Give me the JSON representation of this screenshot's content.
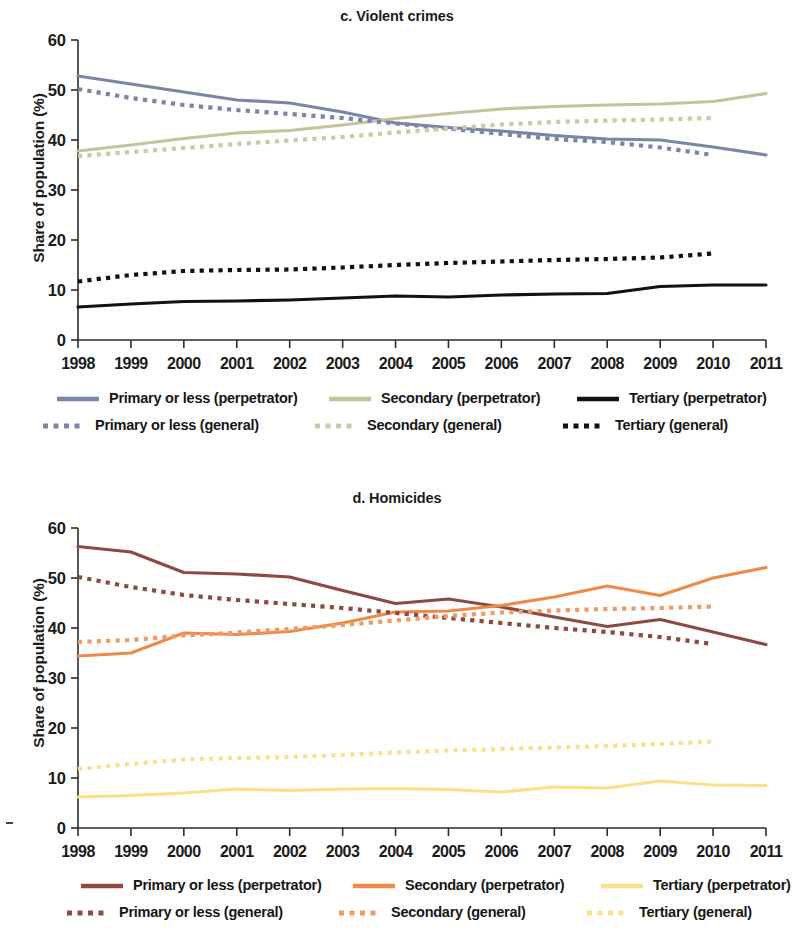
{
  "figure": {
    "panels": [
      {
        "id": "c",
        "title": "c. Violent crimes",
        "ylabel": "Share of population (%)"
      },
      {
        "id": "d",
        "title": "d. Homicides",
        "ylabel": "Share of population (%)"
      }
    ]
  },
  "axis": {
    "y_ticks": [
      "0",
      "10",
      "20",
      "30",
      "40",
      "50",
      "60"
    ],
    "x_ticks": [
      "1998",
      "1999",
      "2000",
      "2001",
      "2002",
      "2003",
      "2004",
      "2005",
      "2006",
      "2007",
      "2008",
      "2009",
      "2010",
      "2011"
    ]
  },
  "colors": {
    "primary_perpetrator_c": "#7b85a8",
    "secondary_perpetrator_c": "#c3c49a",
    "tertiary_perpetrator_c": "#111111",
    "primary_general_c": "#7b85a8",
    "secondary_general_c": "#c9caa6",
    "tertiary_general_c": "#111111",
    "primary_perpetrator_d": "#8d4a42",
    "secondary_perpetrator_d": "#ed8a4a",
    "tertiary_perpetrator_d": "#fbe08a",
    "primary_general_d": "#8d4a42",
    "secondary_general_d": "#f09a66",
    "tertiary_general_d": "#fbdf8e"
  },
  "legend_c": {
    "rows": [
      [
        {
          "label": "Primary or less (perpetrator)",
          "style": "solid",
          "color": "#7b85a8"
        },
        {
          "label": "Secondary (perpetrator)",
          "style": "solid",
          "color": "#c3c49a"
        },
        {
          "label": "Tertiary (perpetrator)",
          "style": "solid",
          "color": "#111111"
        }
      ],
      [
        {
          "label": "Primary or less (general)",
          "style": "dotted",
          "color": "#7b85a8"
        },
        {
          "label": "Secondary (general)",
          "style": "dotted",
          "color": "#c9caa6"
        },
        {
          "label": "Tertiary (general)",
          "style": "dotted",
          "color": "#111111"
        }
      ]
    ]
  },
  "legend_d": {
    "rows": [
      [
        {
          "label": "Primary or less (perpetrator)",
          "style": "solid",
          "color": "#8d4a42"
        },
        {
          "label": "Secondary (perpetrator)",
          "style": "solid",
          "color": "#ed8a4a"
        },
        {
          "label": "Tertiary (perpetrator)",
          "style": "solid",
          "color": "#fbe08a"
        }
      ],
      [
        {
          "label": "Primary or less (general)",
          "style": "dotted",
          "color": "#8d4a42"
        },
        {
          "label": "Secondary (general)",
          "style": "dotted",
          "color": "#f09a66"
        },
        {
          "label": "Tertiary (general)",
          "style": "dotted",
          "color": "#fbdf8e"
        }
      ]
    ]
  },
  "chart_data": [
    {
      "type": "line",
      "title": "c. Violent crimes",
      "xlabel": "",
      "ylabel": "Share of population (%)",
      "x": [
        1998,
        1999,
        2000,
        2001,
        2002,
        2003,
        2004,
        2005,
        2006,
        2007,
        2008,
        2009,
        2010,
        2011
      ],
      "xlim": [
        1998,
        2011
      ],
      "ylim": [
        0,
        60
      ],
      "yticks": [
        0,
        10,
        20,
        30,
        40,
        50,
        60
      ],
      "grid": false,
      "legend_position": "bottom",
      "series": [
        {
          "name": "Primary or less (perpetrator)",
          "style": "solid",
          "color": "#7b85a8",
          "values": [
            52.8,
            51.2,
            49.6,
            48.0,
            47.4,
            45.6,
            43.4,
            42.5,
            41.8,
            40.9,
            40.2,
            40.0,
            38.6,
            37.0
          ]
        },
        {
          "name": "Secondary (perpetrator)",
          "style": "solid",
          "color": "#c3c49a",
          "values": [
            37.8,
            39.0,
            40.3,
            41.4,
            41.9,
            43.0,
            44.3,
            45.3,
            46.2,
            46.7,
            47.0,
            47.2,
            47.7,
            49.3
          ]
        },
        {
          "name": "Tertiary (perpetrator)",
          "style": "solid",
          "color": "#111111",
          "values": [
            6.6,
            7.2,
            7.7,
            7.8,
            8.0,
            8.4,
            8.8,
            8.6,
            9.0,
            9.2,
            9.3,
            10.7,
            11.0,
            11.0
          ]
        },
        {
          "name": "Primary or less (general)",
          "style": "dotted",
          "color": "#7b85a8",
          "values": [
            50.2,
            48.4,
            47.0,
            46.0,
            45.2,
            44.4,
            43.3,
            42.3,
            41.2,
            40.2,
            39.6,
            38.5,
            37.0,
            null
          ]
        },
        {
          "name": "Secondary (general)",
          "style": "dotted",
          "color": "#c9caa6",
          "values": [
            36.8,
            37.6,
            38.4,
            39.2,
            39.9,
            40.6,
            41.5,
            42.3,
            43.1,
            43.6,
            43.9,
            44.1,
            44.4,
            null
          ]
        },
        {
          "name": "Tertiary (general)",
          "style": "dotted",
          "color": "#111111",
          "values": [
            11.7,
            13.0,
            13.8,
            14.0,
            14.1,
            14.5,
            15.0,
            15.4,
            15.7,
            16.0,
            16.2,
            16.5,
            17.3,
            null
          ]
        }
      ]
    },
    {
      "type": "line",
      "title": "d. Homicides",
      "xlabel": "",
      "ylabel": "Share of population (%)",
      "x": [
        1998,
        1999,
        2000,
        2001,
        2002,
        2003,
        2004,
        2005,
        2006,
        2007,
        2008,
        2009,
        2010,
        2011
      ],
      "xlim": [
        1998,
        2011
      ],
      "ylim": [
        0,
        60
      ],
      "yticks": [
        0,
        10,
        20,
        30,
        40,
        50,
        60
      ],
      "grid": false,
      "legend_position": "bottom",
      "series": [
        {
          "name": "Primary or less (perpetrator)",
          "style": "solid",
          "color": "#8d4a42",
          "values": [
            56.3,
            55.2,
            51.1,
            50.8,
            50.2,
            47.5,
            44.9,
            45.8,
            44.2,
            42.2,
            40.3,
            41.7,
            39.2,
            36.7
          ]
        },
        {
          "name": "Secondary (perpetrator)",
          "style": "solid",
          "color": "#ed8a4a",
          "values": [
            34.4,
            35.0,
            39.0,
            38.7,
            39.3,
            41.0,
            43.2,
            43.4,
            44.5,
            46.2,
            48.4,
            46.5,
            50.0,
            52.1
          ]
        },
        {
          "name": "Tertiary (perpetrator)",
          "style": "solid",
          "color": "#fbe08a",
          "values": [
            6.2,
            6.5,
            7.0,
            7.8,
            7.5,
            7.8,
            7.9,
            7.7,
            7.2,
            8.2,
            8.0,
            9.4,
            8.6,
            8.5
          ]
        },
        {
          "name": "Primary or less (general)",
          "style": "dotted",
          "color": "#8d4a42",
          "values": [
            50.2,
            48.2,
            46.6,
            45.6,
            44.8,
            44.0,
            43.0,
            42.0,
            41.0,
            40.0,
            39.2,
            38.2,
            36.8,
            null
          ]
        },
        {
          "name": "Secondary (general)",
          "style": "dotted",
          "color": "#f09a66",
          "values": [
            37.2,
            37.6,
            38.5,
            39.1,
            39.8,
            40.6,
            41.5,
            42.4,
            43.1,
            43.5,
            43.8,
            44.0,
            44.3,
            null
          ]
        },
        {
          "name": "Tertiary (general)",
          "style": "dotted",
          "color": "#fbdf8e",
          "values": [
            11.8,
            12.8,
            13.7,
            14.0,
            14.2,
            14.6,
            15.1,
            15.5,
            15.8,
            16.1,
            16.4,
            16.8,
            17.3,
            null
          ]
        }
      ]
    }
  ]
}
